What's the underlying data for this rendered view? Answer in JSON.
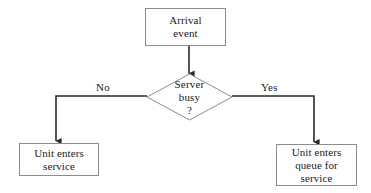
{
  "diagram": {
    "type": "flowchart",
    "background_color": "#ffffff",
    "line_color": "#2a2a2a",
    "box_border_color": "#8c8c8c",
    "text_color": "#1a1a1a",
    "nodes": {
      "arrival_event": {
        "shape": "rectangle",
        "line1": "Arrival",
        "line2": "event"
      },
      "decision": {
        "shape": "diamond",
        "line1": "Server",
        "line2": "busy",
        "line3": "?"
      },
      "enters_service": {
        "shape": "rectangle",
        "line1": "Unit enters",
        "line2": "service"
      },
      "enters_queue": {
        "shape": "rectangle",
        "line1": "Unit enters",
        "line2": "queue for",
        "line3": "service"
      }
    },
    "edges": {
      "no_label": "No",
      "yes_label": "Yes"
    }
  }
}
